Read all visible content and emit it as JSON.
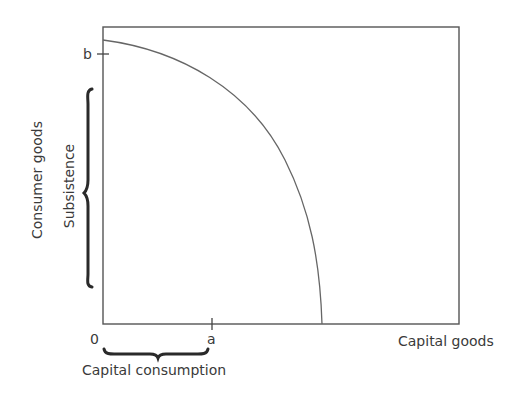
{
  "diagram": {
    "type": "production-possibility-frontier",
    "x_axis_label": "Capital goods",
    "y_axis_label": "Consumer goods",
    "origin_label": "0",
    "x_tick_label": "a",
    "y_tick_label": "b",
    "x_brace_label": "Capital consumption",
    "y_brace_label": "Subsistence",
    "colors": {
      "line": "#555555",
      "curve": "#666666",
      "brace": "#2a2a2a",
      "text": "#3a3a3a"
    }
  }
}
